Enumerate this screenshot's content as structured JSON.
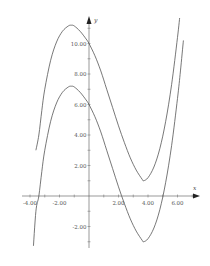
{
  "chart_data": {
    "type": "line",
    "title": "",
    "xlabel": "x",
    "ylabel": "y",
    "xlim": [
      -4.2,
      7.2
    ],
    "ylim": [
      -3.3,
      11.6
    ],
    "grid": false,
    "legend": null,
    "x_ticks": [
      -4,
      -2,
      2,
      4,
      6
    ],
    "x_tick_labels": [
      "-4.00",
      "-2.00",
      "2.00",
      "4.00",
      "6.00"
    ],
    "y_ticks": [
      -2,
      2,
      4,
      6,
      8,
      10
    ],
    "y_tick_labels": [
      "-2.00",
      "2.00",
      "4.00",
      "6.00",
      "8.00",
      "10.00"
    ],
    "series": [
      {
        "name": "upper curve",
        "description": "cubic, local max ≈ (-1.2, 11.2), local min ≈ (3.7, 1.0)",
        "x": [
          -3.6,
          -3.4,
          -3.2,
          -3.0,
          -2.6,
          -2.2,
          -1.8,
          -1.4,
          -1.2,
          -1.0,
          -0.6,
          -0.2,
          0.0,
          0.4,
          0.8,
          1.2,
          1.6,
          2.0,
          2.4,
          2.8,
          3.2,
          3.6,
          3.7,
          4.0,
          4.4,
          4.8,
          5.2,
          5.6,
          6.0,
          6.2,
          6.4
        ],
        "y": [
          3.0,
          4.0,
          5.6,
          7.0,
          8.9,
          10.1,
          10.8,
          11.15,
          11.2,
          11.15,
          10.8,
          10.3,
          10.0,
          9.2,
          8.2,
          7.0,
          5.8,
          4.6,
          3.5,
          2.5,
          1.7,
          1.1,
          1.0,
          1.2,
          1.9,
          3.1,
          4.9,
          7.3,
          10.4,
          12.2,
          14.2
        ]
      },
      {
        "name": "lower curve",
        "description": "same cubic shifted down 4; roots ≈ -3.3, 2.0, 5.0; max ≈ (-1.2, 7.2), min ≈ (3.7, -3.0)",
        "x": [
          -3.8,
          -3.6,
          -3.4,
          -3.2,
          -3.0,
          -2.6,
          -2.2,
          -1.8,
          -1.4,
          -1.2,
          -1.0,
          -0.6,
          -0.2,
          0.0,
          0.4,
          0.8,
          1.2,
          1.6,
          2.0,
          2.4,
          2.8,
          3.2,
          3.6,
          3.7,
          4.0,
          4.4,
          4.8,
          5.2,
          5.6,
          6.0,
          6.2,
          6.4
        ],
        "y": [
          -3.8,
          -1.0,
          0.0,
          1.6,
          3.0,
          4.9,
          6.1,
          6.8,
          7.15,
          7.2,
          7.15,
          6.8,
          6.3,
          6.0,
          5.2,
          4.2,
          3.0,
          1.8,
          0.6,
          -0.5,
          -1.5,
          -2.3,
          -2.9,
          -3.0,
          -2.8,
          -2.1,
          -0.9,
          0.9,
          3.3,
          6.4,
          8.2,
          10.2
        ]
      }
    ]
  },
  "axes": {
    "x_label": "x",
    "y_label": "y"
  }
}
